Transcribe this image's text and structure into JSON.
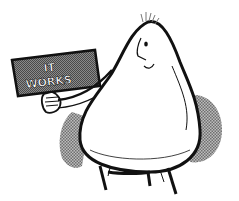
{
  "illustration": {
    "subject": "pear-shaped cartoon character holding a sign",
    "sign": {
      "line1": "IT",
      "line2": "WORKS"
    },
    "colors": {
      "background": "#ffffff",
      "ink": "#111111",
      "shadow": "#9a9a9a",
      "sign_board": "#6e6e6e",
      "body": "#ffffff"
    }
  }
}
